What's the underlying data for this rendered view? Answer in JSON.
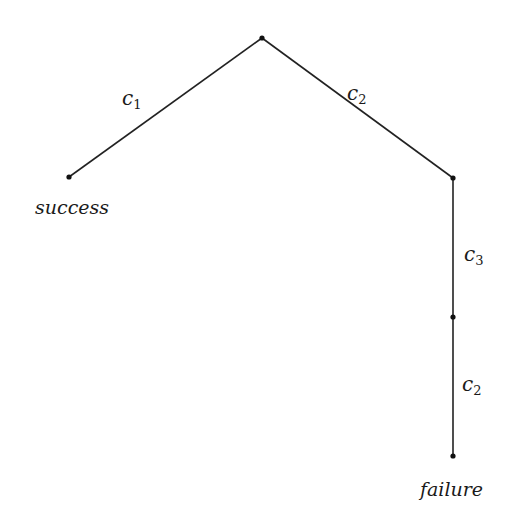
{
  "diagram": {
    "type": "tree",
    "nodes": [
      {
        "id": "root",
        "x": 262,
        "y": 38,
        "label": ""
      },
      {
        "id": "success",
        "x": 69,
        "y": 177,
        "label": "success"
      },
      {
        "id": "right",
        "x": 453,
        "y": 178,
        "label": ""
      },
      {
        "id": "mid",
        "x": 453,
        "y": 317,
        "label": ""
      },
      {
        "id": "failure",
        "x": 453,
        "y": 456,
        "label": "failure"
      }
    ],
    "edges": [
      {
        "from": "root",
        "to": "success",
        "label": "c",
        "sub": "1"
      },
      {
        "from": "root",
        "to": "right",
        "label": "c",
        "sub": "2"
      },
      {
        "from": "right",
        "to": "mid",
        "label": "c",
        "sub": "3"
      },
      {
        "from": "mid",
        "to": "failure",
        "label": "c",
        "sub": "2"
      }
    ]
  }
}
